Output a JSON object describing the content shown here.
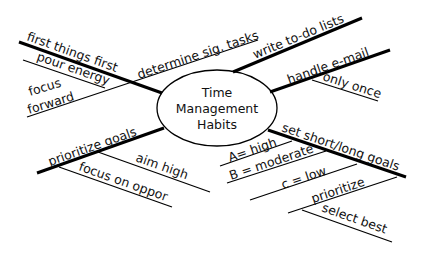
{
  "diagram": {
    "type": "mind-map",
    "center": {
      "lines": [
        "Time",
        "Management",
        "Habits"
      ]
    },
    "branches": [
      {
        "id": "first-things-first",
        "label": "first things first",
        "children": [
          {
            "label": "pour energy"
          },
          {
            "label_line1": "focus",
            "label_line2": "forward"
          }
        ]
      },
      {
        "id": "determine-sig-tasks",
        "label": "determine sig. tasks",
        "children": []
      },
      {
        "id": "write-to-do-lists",
        "label": "write to-do lists",
        "children": []
      },
      {
        "id": "handle-e-mail",
        "label": "handle e-mail",
        "children": [
          {
            "label": "only once"
          }
        ]
      },
      {
        "id": "prioritize-goals",
        "label": "prioritize goals",
        "children": [
          {
            "label": "aim high"
          },
          {
            "label": "focus on oppor"
          }
        ]
      },
      {
        "id": "set-short-long-goals",
        "label": "set short/long goals",
        "children": [
          {
            "label": "A= high"
          },
          {
            "label": "B = moderate"
          },
          {
            "label": "c = low"
          },
          {
            "label": "prioritize",
            "children": [
              {
                "label": "select best"
              }
            ]
          }
        ]
      }
    ]
  }
}
